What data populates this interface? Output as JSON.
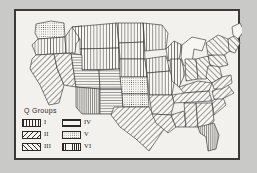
{
  "figure": {
    "background_color": "#c9c9c7",
    "plate_background": "#f2f1ee",
    "ink_color": "#2b2a28",
    "frame_color": "#3b3a38"
  },
  "legend": {
    "title": "Q Groups",
    "items": [
      {
        "label": "I",
        "pattern": "vertical-lines",
        "pattern_class": "pat-vert"
      },
      {
        "label": "II",
        "pattern": "diagonal-backslash",
        "pattern_class": "pat-diag-back"
      },
      {
        "label": "III",
        "pattern": "diagonal-forwardslash",
        "pattern_class": "pat-diag-fwd"
      },
      {
        "label": "IV",
        "pattern": "horizontal-lines",
        "pattern_class": "pat-horz"
      },
      {
        "label": "V",
        "pattern": "stipple-dots",
        "pattern_class": "pat-dots"
      },
      {
        "label": "VI",
        "pattern": "dense-vertical-lines",
        "pattern_class": "pat-vert-dense"
      }
    ]
  },
  "map": {
    "title": "United States Q Groups choropleth",
    "regions": [
      {
        "name": "washington",
        "group": "V"
      },
      {
        "name": "oregon",
        "group": "I"
      },
      {
        "name": "idaho",
        "group": "I"
      },
      {
        "name": "montana",
        "group": "I"
      },
      {
        "name": "wyoming",
        "group": "I"
      },
      {
        "name": "north-dakota",
        "group": "I"
      },
      {
        "name": "south-dakota",
        "group": "I"
      },
      {
        "name": "nebraska",
        "group": "I"
      },
      {
        "name": "california",
        "group": "III"
      },
      {
        "name": "nevada",
        "group": "III"
      },
      {
        "name": "utah",
        "group": "IV"
      },
      {
        "name": "colorado",
        "group": "IV"
      },
      {
        "name": "arizona",
        "group": "VI"
      },
      {
        "name": "new-mexico",
        "group": "IV"
      },
      {
        "name": "kansas",
        "group": "V"
      },
      {
        "name": "oklahoma",
        "group": "V"
      },
      {
        "name": "texas",
        "group": "III"
      },
      {
        "name": "minnesota",
        "group": "I"
      },
      {
        "name": "iowa",
        "group": "I"
      },
      {
        "name": "missouri",
        "group": "I"
      },
      {
        "name": "arkansas",
        "group": "III"
      },
      {
        "name": "louisiana",
        "group": "III"
      },
      {
        "name": "wisconsin",
        "group": "I"
      },
      {
        "name": "illinois",
        "group": "I"
      },
      {
        "name": "michigan",
        "group": "none"
      },
      {
        "name": "indiana",
        "group": "II"
      },
      {
        "name": "ohio",
        "group": "II"
      },
      {
        "name": "kentucky",
        "group": "III"
      },
      {
        "name": "tennessee",
        "group": "III"
      },
      {
        "name": "mississippi",
        "group": "III"
      },
      {
        "name": "alabama",
        "group": "III"
      },
      {
        "name": "georgia",
        "group": "III"
      },
      {
        "name": "florida",
        "group": "VI"
      },
      {
        "name": "south-carolina",
        "group": "III"
      },
      {
        "name": "north-carolina",
        "group": "III"
      },
      {
        "name": "virginia",
        "group": "III"
      },
      {
        "name": "west-virginia",
        "group": "II"
      },
      {
        "name": "pennsylvania",
        "group": "II"
      },
      {
        "name": "new-york",
        "group": "II"
      },
      {
        "name": "new-england",
        "group": "II"
      },
      {
        "name": "maine",
        "group": "none"
      }
    ]
  }
}
